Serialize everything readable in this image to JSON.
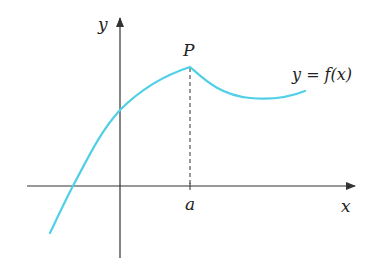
{
  "diagram": {
    "labels": {
      "y_axis": "y",
      "x_axis": "x",
      "point": "P",
      "function": "y = f(x)",
      "x_tick": "a"
    },
    "colors": {
      "curve": "#4fd0e6",
      "axes": "#333333",
      "text": "#222222"
    }
  }
}
